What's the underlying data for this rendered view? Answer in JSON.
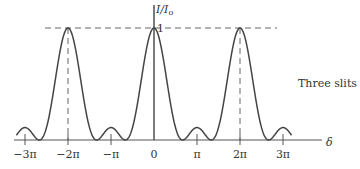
{
  "chart_data": {
    "type": "line",
    "title": "",
    "annotation": "Three slits",
    "xlabel": "δ",
    "ylabel": "I / I₀",
    "y_peak_label": "1",
    "x_ticks": [
      {
        "value": -3,
        "label": "−3π"
      },
      {
        "value": -2,
        "label": "−2π"
      },
      {
        "value": -1,
        "label": "−π"
      },
      {
        "value": 0,
        "label": "0"
      },
      {
        "value": 1,
        "label": "π"
      },
      {
        "value": 2,
        "label": "2π"
      },
      {
        "value": 3,
        "label": "3π"
      }
    ],
    "x_units": "π",
    "xlim": [
      -3.2,
      3.2
    ],
    "ylim": [
      0,
      1
    ],
    "formula": "I/I0 = [sin(3δ/2) / (3 sin(δ/2))]^2",
    "series": [
      {
        "name": "Three slits",
        "x": [
          -3,
          -2.667,
          -2,
          -1.333,
          -1,
          -0.667,
          0,
          0.667,
          1,
          1.333,
          2,
          2.667,
          3
        ],
        "values": [
          0.111,
          0,
          1,
          0,
          0.111,
          0,
          1,
          0,
          0.111,
          0,
          1,
          0,
          0.111
        ]
      }
    ],
    "principal_maxima_at": [
      -2,
      0,
      2
    ],
    "secondary_maxima_at": [
      -3,
      -1,
      1,
      3
    ],
    "secondary_max_value": 0.111,
    "dashed_guides": {
      "horizontal_at_y": 1,
      "vertical_at_x": [
        -2,
        2
      ]
    },
    "grid": false,
    "legend": "none"
  },
  "labels": {
    "annotation": "Three slits",
    "xlabel": "δ",
    "ylabel_I": "I",
    "ylabel_I0": "I",
    "ylabel_sub": "o",
    "one": "1",
    "ticks": [
      "−3π",
      "−2π",
      "−π",
      "0",
      "π",
      "2π",
      "3π"
    ]
  }
}
